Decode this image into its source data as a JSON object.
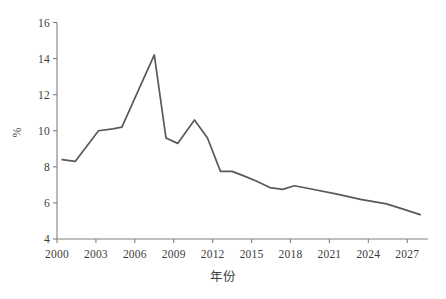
{
  "chart_data": {
    "type": "line",
    "title": "",
    "subtitle": "",
    "xlabel": "年份",
    "ylabel": "%",
    "xlim": [
      2000,
      2028.6
    ],
    "ylim": [
      4,
      16
    ],
    "grid": false,
    "legend": null,
    "line_color": "#595959",
    "axis_color": "#808080",
    "x_tick_labels": [
      "2000",
      "2003",
      "2006",
      "2009",
      "2012",
      "2015",
      "2018",
      "2021",
      "2024",
      "2027"
    ],
    "x_tick_values": [
      2000,
      2003,
      2006,
      2009,
      2012,
      2015,
      2018,
      2021,
      2024,
      2027
    ],
    "y_tick_labels": [
      "4",
      "6",
      "8",
      "10",
      "12",
      "14",
      "16"
    ],
    "y_tick_values": [
      4,
      6,
      8,
      10,
      12,
      14,
      16
    ],
    "x": [
      2000.4,
      2001.4,
      2003.2,
      2004.3,
      2005.0,
      2007.5,
      2008.4,
      2009.3,
      2010.6,
      2011.6,
      2012.6,
      2013.5,
      2014.4,
      2015.4,
      2016.4,
      2017.4,
      2018.3,
      2019.4,
      2021.5,
      2023.4,
      2025.4,
      2026.5,
      2028.0
    ],
    "values": [
      8.4,
      8.3,
      10.0,
      10.1,
      10.2,
      14.2,
      9.6,
      9.3,
      10.6,
      9.6,
      7.75,
      7.75,
      7.5,
      7.2,
      6.85,
      6.75,
      6.95,
      6.8,
      6.5,
      6.2,
      5.95,
      5.7,
      5.35
    ],
    "series": [
      {
        "name": "",
        "color": "#595959",
        "points": [
          {
            "x": 2000.4,
            "y": 8.4
          },
          {
            "x": 2001.4,
            "y": 8.3
          },
          {
            "x": 2003.2,
            "y": 10.0
          },
          {
            "x": 2004.3,
            "y": 10.1
          },
          {
            "x": 2005.0,
            "y": 10.2
          },
          {
            "x": 2007.5,
            "y": 14.2
          },
          {
            "x": 2008.4,
            "y": 9.6
          },
          {
            "x": 2009.3,
            "y": 9.3
          },
          {
            "x": 2010.6,
            "y": 10.6
          },
          {
            "x": 2011.6,
            "y": 9.6
          },
          {
            "x": 2012.6,
            "y": 7.75
          },
          {
            "x": 2013.5,
            "y": 7.75
          },
          {
            "x": 2014.4,
            "y": 7.5
          },
          {
            "x": 2015.4,
            "y": 7.2
          },
          {
            "x": 2016.4,
            "y": 6.85
          },
          {
            "x": 2017.4,
            "y": 6.75
          },
          {
            "x": 2018.3,
            "y": 6.95
          },
          {
            "x": 2019.4,
            "y": 6.8
          },
          {
            "x": 2021.5,
            "y": 6.5
          },
          {
            "x": 2023.4,
            "y": 6.2
          },
          {
            "x": 2025.4,
            "y": 5.95
          },
          {
            "x": 2026.5,
            "y": 5.7
          },
          {
            "x": 2028.0,
            "y": 5.35
          }
        ]
      }
    ]
  }
}
